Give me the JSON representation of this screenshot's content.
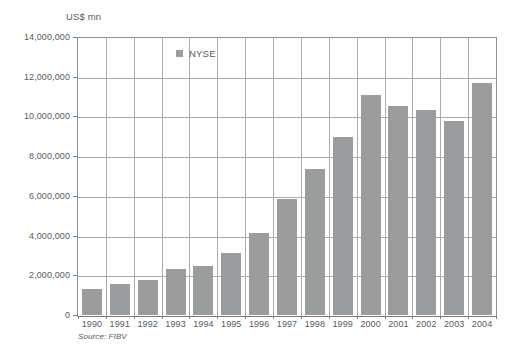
{
  "chart_data": {
    "type": "bar",
    "title": "",
    "subtitle": "",
    "unit_label": "US$ mn",
    "xlabel": "",
    "ylabel": "US$ mn",
    "categories": [
      "1990",
      "1991",
      "1992",
      "1993",
      "1994",
      "1995",
      "1996",
      "1997",
      "1998",
      "1999",
      "2000",
      "2001",
      "2002",
      "2003",
      "2004"
    ],
    "values": [
      1330000,
      1550000,
      1780000,
      2300000,
      2450000,
      3100000,
      4150000,
      5850000,
      7350000,
      8950000,
      11100000,
      10550000,
      10300000,
      9750000,
      11700000
    ],
    "series": [
      {
        "name": "NYSE",
        "color": "#9a9c9e",
        "values": [
          1330000,
          1550000,
          1780000,
          2300000,
          2450000,
          3100000,
          4150000,
          5850000,
          7350000,
          8950000,
          11100000,
          10550000,
          10300000,
          9750000,
          11700000
        ]
      }
    ],
    "ylim": [
      0,
      14000000
    ],
    "ytick_values": [
      0,
      2000000,
      4000000,
      6000000,
      8000000,
      10000000,
      12000000,
      14000000
    ],
    "ytick_labels": [
      "0",
      "2,000,000",
      "4,000,000",
      "6,000,000",
      "8,000,000",
      "10,000,000",
      "12,000,000",
      "14,000,000"
    ],
    "grid": "horizontal-and-vertical",
    "legend": {
      "position": "inside-top-center",
      "entries": [
        {
          "label": "NYSE",
          "marker": "square",
          "color": "#9a9c9e"
        }
      ]
    },
    "annotations": [
      {
        "name": "source-note",
        "text": "Source: FIBV"
      }
    ]
  },
  "colors": {
    "bar": "#9a9c9e",
    "gridline": "#a9abad",
    "axis": "#7a7c7e",
    "text": "#58595b",
    "background": "#ffffff"
  },
  "source": {
    "text": "Source: FIBV"
  }
}
